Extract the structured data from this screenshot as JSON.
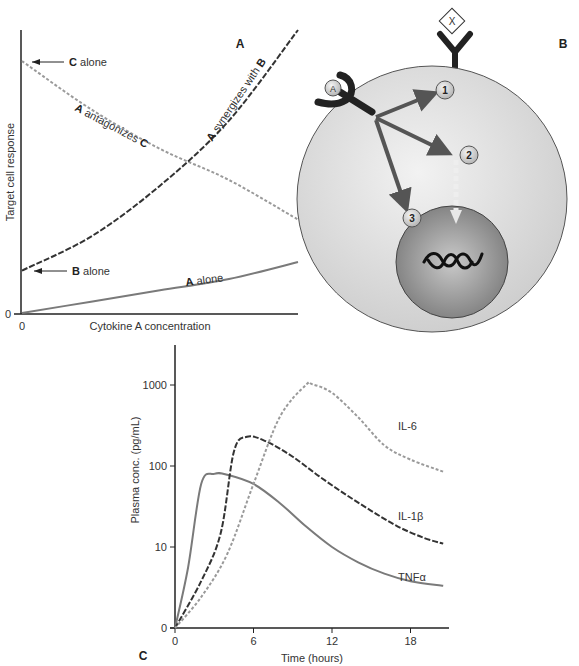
{
  "panel_a": {
    "label": "A",
    "y_axis_label": "Target cell response",
    "x_axis_label": "Cytokine A concentration",
    "y_zero": "0",
    "x_zero": "0",
    "annotations": {
      "c_alone": {
        "bold": "C",
        "text": " alone"
      },
      "b_alone": {
        "bold": "B",
        "text": " alone"
      },
      "a_alone": {
        "bold": "A",
        "text": " alone"
      },
      "antagonizes": {
        "bold1": "A",
        "text": " antagonizes ",
        "bold2": "C"
      },
      "synergizes": {
        "bold1": "A",
        "text": " synergizes with ",
        "bold2": "B"
      }
    }
  },
  "panel_b": {
    "label": "B",
    "ligand_a": "A",
    "ligand_x": "X",
    "steps": [
      "1",
      "2",
      "3"
    ]
  },
  "panel_c": {
    "label": "C"
  },
  "chart_data": [
    {
      "type": "line",
      "title": "A",
      "xlabel": "Cytokine A concentration",
      "ylabel": "Target cell response",
      "x_ticks": [
        "0"
      ],
      "y_ticks": [
        "0"
      ],
      "xlim": [
        0,
        1
      ],
      "ylim": [
        0,
        1
      ],
      "series": [
        {
          "name": "A antagonizes C",
          "style": "dashed-light",
          "x": [
            0,
            0.25,
            0.5,
            0.75,
            1.0
          ],
          "y": [
            0.89,
            0.72,
            0.58,
            0.47,
            0.33
          ]
        },
        {
          "name": "A synergizes with B",
          "style": "dashed-dark",
          "x": [
            0,
            0.25,
            0.5,
            0.75,
            1.0
          ],
          "y": [
            0.15,
            0.27,
            0.45,
            0.68,
            1.0
          ]
        },
        {
          "name": "A alone",
          "style": "solid",
          "x": [
            0,
            0.25,
            0.5,
            0.75,
            1.0
          ],
          "y": [
            0.0,
            0.04,
            0.08,
            0.12,
            0.18
          ]
        }
      ],
      "annotations": [
        "C alone",
        "B alone",
        "A alone",
        "A antagonizes C",
        "A synergizes with B"
      ]
    },
    {
      "type": "line",
      "title": "C",
      "xlabel": "Time (hours)",
      "ylabel": "Plasma conc. (pg/mL)",
      "x_ticks": [
        "0",
        "6",
        "12",
        "18"
      ],
      "y_ticks": [
        "0",
        "10",
        "100",
        "1000"
      ],
      "y_scale": "log",
      "xlim": [
        0,
        21
      ],
      "ylim": [
        0,
        2000
      ],
      "series": [
        {
          "name": "TNFα",
          "style": "solid",
          "color": "#777777",
          "x": [
            0,
            1,
            2,
            3,
            4,
            6,
            8,
            10,
            12,
            14,
            16,
            18,
            20.5
          ],
          "y": [
            0,
            5,
            60,
            80,
            78,
            60,
            35,
            18,
            10,
            6,
            4,
            3,
            2.5
          ]
        },
        {
          "name": "IL-1β",
          "style": "dashed-dark",
          "color": "#333333",
          "x": [
            0,
            2,
            3.5,
            4.5,
            5.5,
            7,
            9,
            11,
            13,
            15,
            17,
            19,
            20.5
          ],
          "y": [
            0,
            3,
            15,
            150,
            230,
            200,
            130,
            75,
            45,
            28,
            18,
            13,
            11
          ]
        },
        {
          "name": "IL-6",
          "style": "dashed-light",
          "color": "#999999",
          "x": [
            0,
            2,
            4,
            6,
            8,
            10,
            10.5,
            12,
            14,
            16,
            18,
            20.5
          ],
          "y": [
            0,
            1.5,
            8,
            60,
            400,
            1000,
            1020,
            800,
            400,
            180,
            120,
            85
          ]
        }
      ]
    }
  ]
}
